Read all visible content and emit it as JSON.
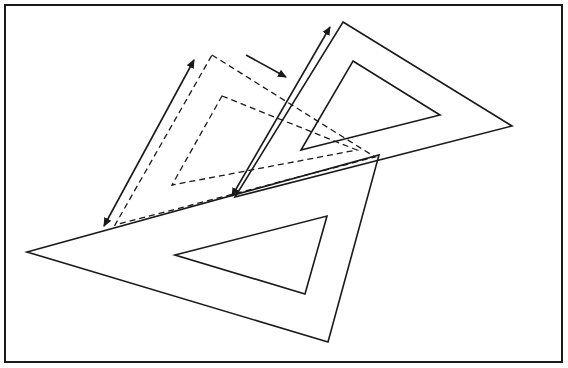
{
  "diagram": {
    "colors": {
      "stroke": "#1a1a1a",
      "background": "#ffffff"
    },
    "frame": {
      "x": 5,
      "y": 5,
      "width": 557,
      "height": 357
    },
    "shapes": {
      "lower_setsquare": {
        "style": "solid",
        "outer": [
          [
            27,
            252
          ],
          [
            379,
            155
          ],
          [
            328,
            342
          ]
        ],
        "inner": [
          [
            175,
            255
          ],
          [
            327,
            216
          ],
          [
            305,
            294
          ]
        ]
      },
      "upper_setsquare_current": {
        "style": "solid",
        "outer": [
          [
            343,
            22
          ],
          [
            512,
            126
          ],
          [
            235,
            197
          ]
        ],
        "inner": [
          [
            353,
            61
          ],
          [
            440,
            115
          ],
          [
            301,
            150
          ]
        ]
      },
      "upper_setsquare_previous": {
        "style": "dashed",
        "outer": [
          [
            212,
            55
          ],
          [
            375,
            157
          ],
          [
            115,
            225
          ]
        ],
        "inner": [
          [
            222,
            96
          ],
          [
            357,
            150
          ],
          [
            172,
            185
          ]
        ]
      }
    },
    "arrows": [
      {
        "name": "slide-left-arrow",
        "from": [
          194,
          60
        ],
        "to": [
          104,
          226
        ],
        "heads": "both"
      },
      {
        "name": "slide-right-arrow",
        "from": [
          232,
          196
        ],
        "to": [
          330,
          27
        ],
        "heads": "both"
      },
      {
        "name": "motion-direction-arrow",
        "from": [
          246,
          55
        ],
        "to": [
          286,
          77
        ],
        "heads": "end"
      }
    ]
  }
}
